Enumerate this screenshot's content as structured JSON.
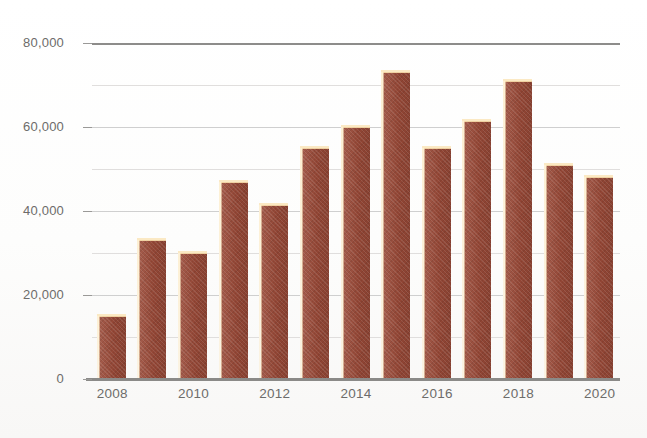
{
  "chart_data": {
    "type": "bar",
    "title": "",
    "subtitle": "",
    "xlabel": "",
    "ylabel": "",
    "categories": [
      "2008",
      "2009",
      "2010",
      "2011",
      "2012",
      "2013",
      "2014",
      "2015",
      "2016",
      "2017",
      "2018",
      "2019",
      "2020"
    ],
    "values": [
      15000,
      33000,
      30000,
      47000,
      41500,
      55000,
      60000,
      73000,
      55000,
      61500,
      71000,
      51000,
      48000
    ],
    "series": [
      {
        "name": "",
        "values": [
          15000,
          33000,
          30000,
          47000,
          41500,
          55000,
          60000,
          73000,
          55000,
          61500,
          71000,
          51000,
          48000
        ]
      }
    ],
    "ylim": [
      0,
      80000
    ],
    "xlim_categories": 13,
    "y_major_ticks": [
      0,
      20000,
      40000,
      60000,
      80000
    ],
    "y_major_tick_labels": [
      "0",
      "20,000",
      "40,000",
      "60,000",
      "80,000"
    ],
    "y_minor_ticks": [
      10000,
      30000,
      50000,
      70000
    ],
    "x_tick_labels_shown": [
      "2008",
      "2010",
      "2012",
      "2014",
      "2016",
      "2018",
      "2020"
    ],
    "grid": true,
    "grid_axis": "y",
    "legend": false,
    "legend_position": "none",
    "bar_color": "#9b4a38",
    "bar_highlight_color": "#fbe9c4",
    "gridline_color": "#cfcfcf",
    "axis_color": "#8b8a88",
    "tick_label_color": "#6d6c6a",
    "background_color": "#ffffff"
  },
  "axis": {
    "y_labels": [
      {
        "text": "80,000",
        "value": 80000
      },
      {
        "text": "60,000",
        "value": 60000
      },
      {
        "text": "40,000",
        "value": 40000
      },
      {
        "text": "20,000",
        "value": 20000
      },
      {
        "text": "0",
        "value": 0
      }
    ],
    "x_labels": [
      {
        "text": "2008",
        "index": 0
      },
      {
        "text": "2010",
        "index": 2
      },
      {
        "text": "2012",
        "index": 4
      },
      {
        "text": "2014",
        "index": 6
      },
      {
        "text": "2016",
        "index": 8
      },
      {
        "text": "2018",
        "index": 10
      },
      {
        "text": "2020",
        "index": 12
      }
    ]
  }
}
